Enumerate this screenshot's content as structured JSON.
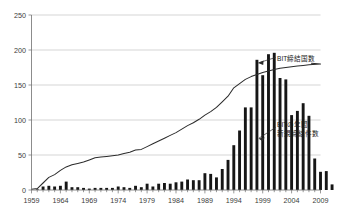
{
  "chart_data": {
    "type": "bar",
    "title": "",
    "subtitle": "",
    "xlabel": "",
    "ylabel": "",
    "xlim": [
      1959,
      2009
    ],
    "ylim": [
      0,
      250
    ],
    "grid": true,
    "legend_position": "inline-annotation",
    "x_tick_labels": [
      "1959",
      "1964",
      "1969",
      "1974",
      "1979",
      "1984",
      "1989",
      "1994",
      "1999",
      "2004",
      "2009"
    ],
    "y_tick_labels": [
      "0",
      "50",
      "100",
      "150",
      "200",
      "250"
    ],
    "x_tick_values": [
      1959,
      1964,
      1969,
      1974,
      1979,
      1984,
      1989,
      1994,
      1999,
      2004,
      2009
    ],
    "y_tick_values": [
      0,
      50,
      100,
      150,
      200,
      250
    ],
    "x": [
      1959,
      1960,
      1961,
      1962,
      1963,
      1964,
      1965,
      1966,
      1967,
      1968,
      1969,
      1970,
      1971,
      1972,
      1973,
      1974,
      1975,
      1976,
      1977,
      1978,
      1979,
      1980,
      1981,
      1982,
      1983,
      1984,
      1985,
      1986,
      1987,
      1988,
      1989,
      1990,
      1991,
      1992,
      1993,
      1994,
      1995,
      1996,
      1997,
      1998,
      1999,
      2000,
      2001,
      2002,
      2003,
      2004,
      2005,
      2006,
      2007
    ],
    "series": [
      {
        "name": "BITの年間新規締結件数",
        "type": "bar",
        "color": "#161616",
        "values": [
          0,
          1,
          5,
          6,
          5,
          6,
          12,
          4,
          4,
          3,
          2,
          3,
          3,
          3,
          3,
          5,
          4,
          3,
          6,
          4,
          9,
          5,
          9,
          10,
          9,
          11,
          12,
          15,
          14,
          14,
          24,
          23,
          18,
          30,
          43,
          64,
          85,
          118,
          118,
          186,
          164,
          194,
          196,
          160,
          158,
          107,
          113,
          124,
          106
        ]
      },
      {
        "name": "BIT締結国数",
        "type": "line",
        "color": "#2b2b2b",
        "values": [
          1,
          2,
          10,
          18,
          22,
          28,
          33,
          36,
          38,
          40,
          43,
          46,
          47,
          48,
          49,
          50,
          52,
          54,
          57,
          58,
          62,
          66,
          70,
          74,
          78,
          82,
          87,
          92,
          96,
          101,
          107,
          112,
          118,
          126,
          134,
          146,
          152,
          158,
          162,
          165,
          168,
          170,
          172,
          174,
          175,
          176,
          177,
          178,
          179
        ]
      }
    ],
    "bar_tail_values": [
      45,
      26,
      27,
      8
    ],
    "annotations": [
      {
        "id": "line-annotation",
        "text": "BIT締結国数",
        "target_series": "BIT締結国数"
      },
      {
        "id": "bar-annotation-line1",
        "text": "BITの年間",
        "target_series": "BITの年間新規締結件数"
      },
      {
        "id": "bar-annotation-line2",
        "text": "新規締結件数",
        "target_series": "BITの年間新規締結件数"
      }
    ],
    "colors": {
      "bar": "#161616",
      "line": "#2b2b2b",
      "grid": "#b9b9b9",
      "axis": "#6e6e6e",
      "text": "#3b3b3b",
      "background": "#ffffff"
    }
  }
}
